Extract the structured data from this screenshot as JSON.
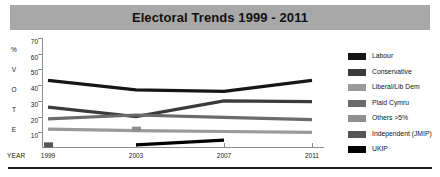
{
  "header": {
    "title": "Electoral Trends 1999 - 2011",
    "banner_color": "#a8a8a8"
  },
  "axis": {
    "vertical_caption_letters": [
      "%",
      "V",
      "O",
      "T",
      "E"
    ],
    "year_caption": "YEAR"
  },
  "legend": {
    "items": [
      {
        "label": "Labour",
        "color": "#161616"
      },
      {
        "label": "Conservative",
        "color": "#3b3b3b"
      },
      {
        "label": "Liberal/Lib Dem",
        "color": "#9a9a9a"
      },
      {
        "label": "Plaid Cymru",
        "color": "#6b6b6b"
      },
      {
        "label": "Others >5%",
        "color": "#8f8f8f"
      },
      {
        "label": "Independent (JMIP)",
        "color": "#555555"
      },
      {
        "label": "UKIP",
        "color": "#000000"
      }
    ]
  },
  "footer": {
    "note": ""
  },
  "chart_data": {
    "type": "line",
    "title": "Electoral Trends 1999 - 2011",
    "xlabel": "YEAR",
    "ylabel": "% VOTE",
    "x": [
      1999,
      2003,
      2007,
      2011
    ],
    "categories": [
      "1999",
      "2003",
      "2007",
      "2011"
    ],
    "xtick_labels": [
      "1999",
      "2003",
      "2007",
      "2011"
    ],
    "ytick_labels": [
      "70",
      "60",
      "50",
      "40",
      "30",
      "20",
      "10"
    ],
    "yticks": [
      70,
      60,
      50,
      40,
      30,
      20,
      10
    ],
    "ylim": [
      0,
      70
    ],
    "grid": false,
    "legend_position": "right",
    "series": [
      {
        "name": "Labour",
        "color": "#161616",
        "x": [
          1999,
          2003,
          2007,
          2011
        ],
        "values": [
          43,
          37,
          36,
          43
        ]
      },
      {
        "name": "Conservative",
        "color": "#3b3b3b",
        "x": [
          1999,
          2003,
          2007,
          2011
        ],
        "values": [
          26,
          20,
          30,
          29.5
        ]
      },
      {
        "name": "Plaid Cymru",
        "color": "#6b6b6b",
        "x": [
          1999,
          2003,
          2007,
          2011
        ],
        "values": [
          18.5,
          21,
          19.5,
          18
        ]
      },
      {
        "name": "Liberal/Lib Dem",
        "color": "#9a9a9a",
        "x": [
          1999,
          2003,
          2007,
          2011
        ],
        "values": [
          12,
          11,
          10.5,
          10
        ]
      },
      {
        "name": "UKIP",
        "color": "#000000",
        "x": [
          2003,
          2007
        ],
        "values": [
          2,
          5
        ]
      },
      {
        "name": "Independent (JMIP)",
        "color": "#555555",
        "x": [
          1999
        ],
        "values": [
          2
        ]
      },
      {
        "name": "Others >5%",
        "color": "#8f8f8f",
        "x": [
          2003
        ],
        "values": [
          12
        ]
      }
    ]
  }
}
